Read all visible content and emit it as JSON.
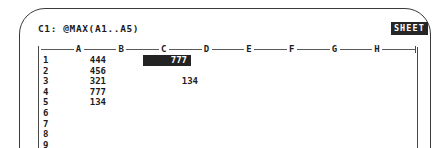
{
  "screen": {
    "mode_indicator": "SHEET",
    "formula_line": "C1: @MAX(A1..A5)",
    "cell_reference": "C1",
    "formula": "@MAX(A1..A5)"
  },
  "grid": {
    "columns": [
      "A",
      "B",
      "C",
      "D",
      "E",
      "F",
      "G",
      "H"
    ],
    "row_numbers": [
      "1",
      "2",
      "3",
      "4",
      "5",
      "6",
      "7",
      "8",
      "9"
    ],
    "cells": {
      "a1": "444",
      "a2": "456",
      "a3": "321",
      "a4": "777",
      "a5": "134",
      "c1": "777",
      "c3": "134"
    },
    "selected_cell": "C1"
  },
  "colors": {
    "screen_background": "#ffffff",
    "text": "#1c1c1c",
    "rule": "#4a4a4a",
    "highlight_background": "#232323",
    "highlight_text": "#ffffff"
  }
}
